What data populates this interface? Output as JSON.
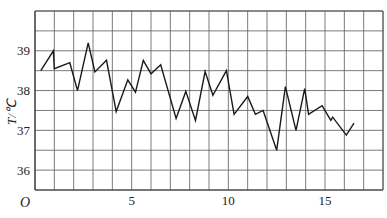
{
  "chart_data": {
    "type": "line",
    "title": "",
    "xlabel": "",
    "ylabel": "T/℃",
    "origin_label": "O",
    "xlim": [
      0,
      18
    ],
    "ylim": [
      35.5,
      40
    ],
    "x_ticks": [
      5,
      10,
      15
    ],
    "y_ticks": [
      36,
      37,
      38,
      39
    ],
    "grid": {
      "on": true,
      "x_step": 1,
      "y_step": 0.5
    },
    "legend": null,
    "series": [
      {
        "name": "temperature",
        "color": "#1a1a1a",
        "points": [
          [
            0.3,
            38.5
          ],
          [
            0.95,
            39.0
          ],
          [
            1.0,
            38.55
          ],
          [
            1.8,
            38.7
          ],
          [
            2.2,
            38.0
          ],
          [
            2.75,
            39.2
          ],
          [
            3.1,
            38.47
          ],
          [
            3.7,
            38.76
          ],
          [
            4.2,
            37.47
          ],
          [
            4.8,
            38.27
          ],
          [
            5.2,
            37.96
          ],
          [
            5.6,
            38.76
          ],
          [
            6.0,
            38.42
          ],
          [
            6.5,
            38.65
          ],
          [
            7.3,
            37.3
          ],
          [
            7.8,
            37.98
          ],
          [
            8.3,
            37.25
          ],
          [
            8.8,
            38.48
          ],
          [
            9.2,
            37.88
          ],
          [
            9.9,
            38.5
          ],
          [
            10.3,
            37.4
          ],
          [
            11.0,
            37.85
          ],
          [
            11.4,
            37.4
          ],
          [
            11.8,
            37.5
          ],
          [
            12.5,
            36.5
          ],
          [
            12.95,
            38.1
          ],
          [
            13.5,
            37.0
          ],
          [
            13.95,
            38.05
          ],
          [
            14.15,
            37.4
          ],
          [
            14.85,
            37.62
          ],
          [
            15.3,
            37.25
          ],
          [
            15.4,
            37.33
          ],
          [
            16.1,
            36.88
          ],
          [
            16.5,
            37.18
          ]
        ]
      }
    ]
  }
}
